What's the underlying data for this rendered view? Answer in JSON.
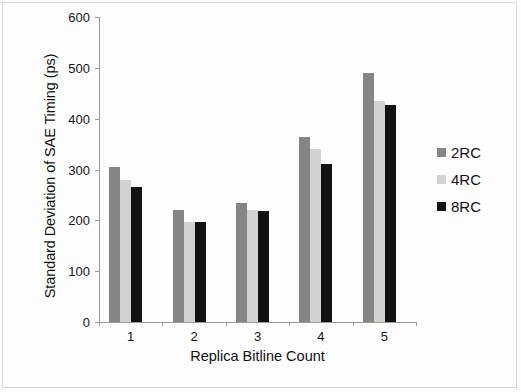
{
  "chart_data": {
    "type": "bar",
    "title": "",
    "xlabel": "Replica Bitline Count",
    "ylabel": "Standard Deviation of SAE Timing (ps)",
    "categories": [
      "1",
      "2",
      "3",
      "4",
      "5"
    ],
    "series": [
      {
        "name": "2RC",
        "color": "#858585",
        "values": [
          305,
          220,
          234,
          363,
          490
        ]
      },
      {
        "name": "4RC",
        "color": "#d2d2d2",
        "values": [
          280,
          197,
          220,
          340,
          434
        ]
      },
      {
        "name": "8RC",
        "color": "#121212",
        "values": [
          265,
          196,
          219,
          310,
          427
        ]
      }
    ],
    "ylim": [
      0,
      600
    ],
    "yticks": [
      0,
      100,
      200,
      300,
      400,
      500,
      600
    ],
    "ytick_labels": [
      "0",
      "100",
      "200",
      "300",
      "400",
      "500",
      "600"
    ],
    "grid": false,
    "legend_position": "right"
  },
  "legend": {
    "items": [
      {
        "label": "2RC",
        "swatch": "#858585"
      },
      {
        "label": "4RC",
        "swatch": "#d2d2d2"
      },
      {
        "label": "8RC",
        "swatch": "#121212"
      }
    ]
  }
}
